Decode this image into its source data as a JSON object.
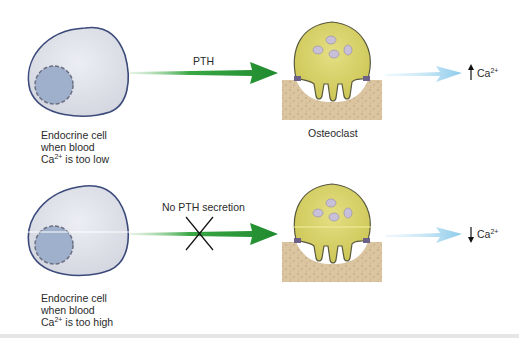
{
  "panels": [
    {
      "endocrine_label": [
        "Endocrine cell",
        "when blood",
        "Ca",
        "2+",
        " is too low"
      ],
      "arrow_label": "PTH",
      "effector_label": "Osteoclast",
      "result": {
        "arrow": "↑",
        "ion": "Ca",
        "charge": "2+"
      }
    },
    {
      "endocrine_label": [
        "Endocrine cell",
        "when blood",
        "Ca",
        "2+",
        " is too high"
      ],
      "arrow_label": "No PTH secretion",
      "effector_label": "",
      "result": {
        "arrow": "↓",
        "ion": "Ca",
        "charge": "2+"
      }
    }
  ],
  "colors": {
    "cell_fill": "#dcdde6",
    "cell_stroke": "#3b4a7a",
    "nucleus_fill": "#9fb0cc",
    "pth_arrow": "#2e9a3a",
    "ca_arrow": "#9fd3ee",
    "osteoclast_fill": "#d8d268",
    "bone_fill": "#d9c3a0"
  }
}
